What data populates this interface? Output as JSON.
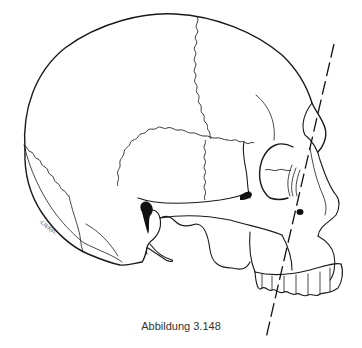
{
  "figure": {
    "caption": "Abbildung 3.148",
    "signature": "-LWRP-",
    "line_color": "#1a1a1a",
    "background": "#ffffff"
  }
}
